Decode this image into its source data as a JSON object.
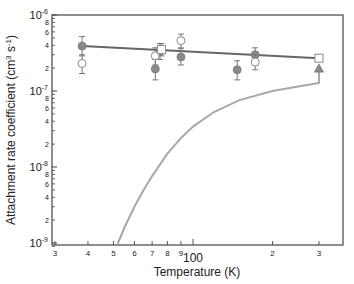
{
  "chart_data": {
    "type": "scatter",
    "title": "",
    "xlabel": "Temperature (K)",
    "ylabel": "Attachment rate coefficient (cm^3 s^-1)",
    "ylabel_parts": {
      "main": "Attachment rate coefficient (cm",
      "sup1": "3",
      "mid": " s",
      "sup2": "-1",
      "end": ")"
    },
    "xscale": "log",
    "yscale": "log",
    "xlim": [
      29,
      330
    ],
    "ylim": [
      8.8e-10,
      1e-06
    ],
    "grid": false,
    "legend": null,
    "x_ticks": [
      {
        "value": 30,
        "label": "3"
      },
      {
        "value": 40,
        "label": "4"
      },
      {
        "value": 50,
        "label": "5"
      },
      {
        "value": 60,
        "label": "6"
      },
      {
        "value": 70,
        "label": "7"
      },
      {
        "value": 80,
        "label": "8"
      },
      {
        "value": 90,
        "label": "9"
      },
      {
        "value": 100,
        "label": "100"
      },
      {
        "value": 200,
        "label": "2"
      },
      {
        "value": 300,
        "label": "3"
      }
    ],
    "y_major_ticks": [
      {
        "value": 1e-06,
        "base": "10",
        "exp": "-6"
      },
      {
        "value": 1e-07,
        "base": "10",
        "exp": "-7"
      },
      {
        "value": 1e-08,
        "base": "10",
        "exp": "-8"
      },
      {
        "value": 1e-09,
        "base": "10",
        "exp": "-9"
      }
    ],
    "y_minor_labels": [
      "2",
      "4",
      "6",
      "8"
    ],
    "series": [
      {
        "name": "filled circles",
        "marker": "filled-circle",
        "color": "#8a8a8a",
        "points": [
          {
            "x": 38,
            "y": 3.9e-07,
            "err_lo": 2.9e-07,
            "err_hi": 5.2e-07
          },
          {
            "x": 72,
            "y": 1.95e-07,
            "err_lo": 1.4e-07,
            "err_hi": 2.6e-07
          },
          {
            "x": 75,
            "y": 3.3e-07,
            "err_lo": 2.6e-07,
            "err_hi": 4.2e-07
          },
          {
            "x": 90,
            "y": 2.8e-07,
            "err_lo": 2.2e-07,
            "err_hi": 3.6e-07
          },
          {
            "x": 147,
            "y": 1.9e-07,
            "err_lo": 1.4e-07,
            "err_hi": 2.5e-07
          },
          {
            "x": 172,
            "y": 3e-07,
            "err_lo": 2.4e-07,
            "err_hi": 3.7e-07
          }
        ]
      },
      {
        "name": "open circles",
        "marker": "open-circle",
        "color": "#8a8a8a",
        "points": [
          {
            "x": 38,
            "y": 2.3e-07,
            "err_lo": 1.7e-07,
            "err_hi": 3e-07
          },
          {
            "x": 72,
            "y": 2.9e-07,
            "err_lo": 2.2e-07,
            "err_hi": 3.7e-07
          },
          {
            "x": 90,
            "y": 4.6e-07,
            "err_lo": 3.7e-07,
            "err_hi": 5.6e-07
          },
          {
            "x": 172,
            "y": 2.4e-07,
            "err_lo": 1.9e-07,
            "err_hi": 3e-07
          }
        ]
      },
      {
        "name": "open squares",
        "marker": "open-square",
        "color": "#8a8a8a",
        "points": [
          {
            "x": 76,
            "y": 3.5e-07,
            "err_lo": 2.9e-07,
            "err_hi": 4.2e-07
          },
          {
            "x": 300,
            "y": 2.7e-07
          }
        ]
      },
      {
        "name": "filled triangle",
        "marker": "filled-triangle",
        "color": "#8a8a8a",
        "points": [
          {
            "x": 300,
            "y": 2e-07
          }
        ]
      },
      {
        "name": "fit line",
        "type": "line",
        "color": "#666666",
        "width": 2,
        "x": [
          38,
          300
        ],
        "y": [
          3.9e-07,
          2.7e-07
        ]
      },
      {
        "name": "model curve",
        "type": "line",
        "color": "#a8a8a8",
        "width": 2,
        "x": [
          52,
          55,
          60,
          65,
          70,
          80,
          90,
          100,
          120,
          150,
          200,
          250,
          300
        ],
        "y": [
          1e-09,
          1.6e-09,
          3e-09,
          5e-09,
          7.6e-09,
          1.5e-08,
          2.4e-08,
          3.4e-08,
          5.3e-08,
          7.6e-08,
          1e-07,
          1.15e-07,
          1.27e-07
        ]
      }
    ]
  }
}
